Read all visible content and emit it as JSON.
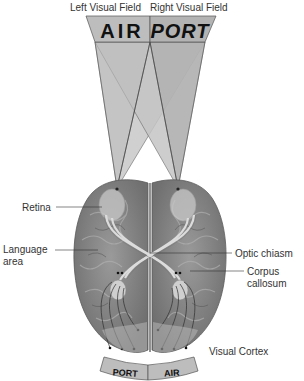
{
  "header": {
    "left_field": "Left Visual Field",
    "right_field": "Right Visual Field"
  },
  "top_banner": {
    "left_word": "AIR",
    "right_word": "PORT"
  },
  "bottom_banner": {
    "left_word": "PORT",
    "right_word": "AIR"
  },
  "labels": {
    "retina": "Retina",
    "language_area_1": "Language",
    "language_area_2": "area",
    "optic_chiasm": "Optic chiasm",
    "corpus_callosum_1": "Corpus",
    "corpus_callosum_2": "callosum",
    "visual_cortex": "Visual Cortex"
  },
  "colors": {
    "banner_fill": "#bdbdbd",
    "beam_light": "#d2d2d2",
    "beam_dark": "#a8a8a8",
    "brain": "#8a8a8a",
    "brain_dark": "#6e6e6e",
    "pathway": "#d9d9d9",
    "label_text": "#333333"
  }
}
